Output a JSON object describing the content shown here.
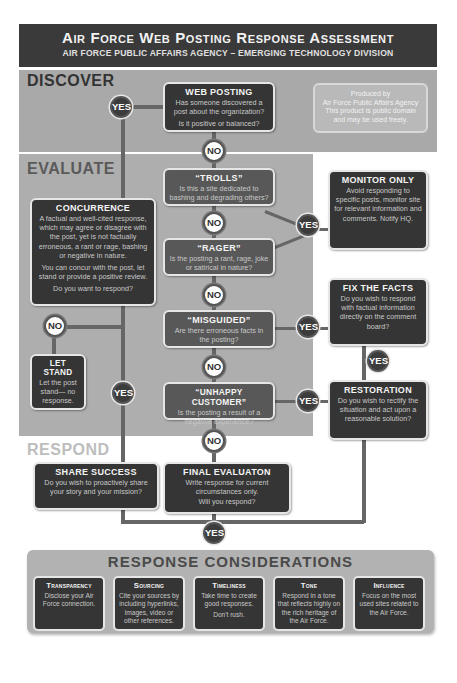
{
  "header": {
    "title": "Air Force Web Posting Response Assessment",
    "subtitle": "AIR FORCE PUBLIC AFFAIRS AGENCY – EMERGING TECHNOLOGY DIVISION"
  },
  "sections": {
    "discover": "DISCOVER",
    "evaluate": "EVALUATE",
    "respond": "RESPOND"
  },
  "note": {
    "line1": "Produced by",
    "line2": "Air Force Public Affairs Agency",
    "line3": "This product is public domain",
    "line4": "and may be used freely."
  },
  "nodes": {
    "web_posting": {
      "title": "WEB POSTING",
      "desc1": "Has someone discovered a post about the organization?",
      "desc2": "Is it positive or balanced?"
    },
    "trolls": {
      "title": "“TROLLS”",
      "desc1": "Is this a site dedicated to bashing and degrading others?"
    },
    "rager": {
      "title": "“RAGER”",
      "desc1": "Is the posting a rant, rage, joke or satirical in nature?"
    },
    "misguided": {
      "title": "“MISGUIDED”",
      "desc1": "Are there erroneous facts in the posting?"
    },
    "unhappy_customer": {
      "title": "“UNHAPPY CUSTOMER”",
      "desc1": "Is the posting a result of a negative experience?"
    },
    "concurrence": {
      "title": "CONCURRENCE",
      "desc1": "A factual and well-cited response, which may agree or disagree with the post, yet is not factually erroneous, a rant or rage, bashing or negative in nature.",
      "desc2": "You can concur with the post, let stand or provide a positive review.",
      "desc3": "Do you want to respond?"
    },
    "let_stand": {
      "title": "LET STAND",
      "desc1": "Let the post stand— no response."
    },
    "monitor_only": {
      "title": "MONITOR ONLY",
      "desc1": "Avoid responding to specific posts, monitor site for relevant information and comments. Notify HQ."
    },
    "fix_the_facts": {
      "title": "FIX THE FACTS",
      "desc1": "Do you wish to respond with factual information directly on the comment board?"
    },
    "restoration": {
      "title": "RESTORATION",
      "desc1": "Do you wish to rectify the situation and act upon a reasonable solution?"
    },
    "share_success": {
      "title": "SHARE SUCCESS",
      "desc1": "Do you wish to proactively share your story and your mission?"
    },
    "final_evaluation": {
      "title": "FINAL EVALUATON",
      "desc1": "Write response for current circumstances only.",
      "desc2": "Will you respond?"
    }
  },
  "badges": {
    "yes": "YES",
    "no": "NO"
  },
  "response_considerations": {
    "title": "RESPONSE CONSIDERATIONS",
    "items": [
      {
        "title": "Transparency",
        "desc": "Disclose your Air Force connection."
      },
      {
        "title": "Sourcing",
        "desc": "Cite your sources by including hyperlinks, images, video or other references."
      },
      {
        "title": "Timeliness",
        "desc": "Take time to create good responses.",
        "desc2": "Don't rush."
      },
      {
        "title": "Tone",
        "desc": "Respond in a tone that reflects highly on the rich heritage of the Air Force."
      },
      {
        "title": "Influence",
        "desc": "Focus on the most used sites related to the Air Force."
      }
    ]
  },
  "colors": {
    "header_bg": "#3a3a3a",
    "discover_bg": "#a9a9a9",
    "evaluate_bg": "#aeaeae",
    "dark_box": "#353535",
    "mid_box": "#585858",
    "connector": "#666666"
  }
}
